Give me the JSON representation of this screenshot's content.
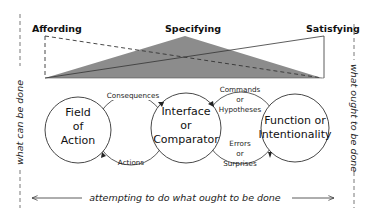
{
  "top_labels": {
    "left": "Affording",
    "center": "Specifying",
    "right": "Satisfying"
  },
  "side_labels": {
    "left": "what can be done",
    "right": "what ought to be done",
    "bottom": "attempting to do what ought to be done"
  },
  "nodes": {
    "field": [
      "Field",
      "of",
      "Action"
    ],
    "interface": [
      "Interface",
      "or",
      "Comparator"
    ],
    "function": [
      "Function or",
      "Intentionality"
    ]
  },
  "links": {
    "consequences": "Consequences",
    "actions": "Actions",
    "commands": [
      "Commands",
      "or",
      "Hypotheses"
    ],
    "errors": [
      "Errors",
      "or",
      "Surprises"
    ]
  },
  "colors": {
    "triangle_fill": "#8c8c8c",
    "line": "#333333"
  }
}
